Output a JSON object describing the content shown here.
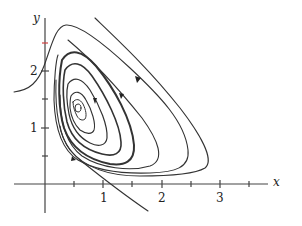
{
  "figure": {
    "type": "phase-portrait",
    "axes": {
      "x_label": "x",
      "y_label": "y",
      "x_tick_labels": [
        "1",
        "2",
        "3"
      ],
      "y_tick_labels": [
        "1",
        "2"
      ],
      "x_range": [
        -0.3,
        3.6
      ],
      "y_range": [
        -0.5,
        2.9
      ],
      "tick_step": 0.5
    },
    "equilibrium": {
      "x": 0.5,
      "y": 1.5
    },
    "colors": {
      "curve": "#333333",
      "axis": "#444444",
      "highlight_tick": "#d04040"
    }
  }
}
